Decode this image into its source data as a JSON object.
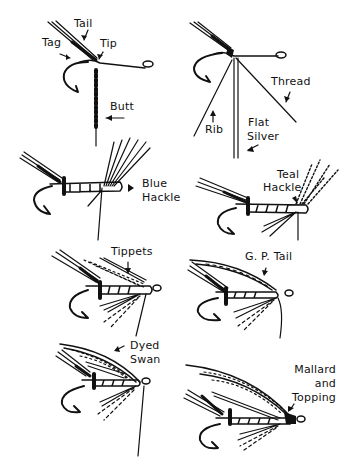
{
  "diagram": {
    "ink_color": "#111111",
    "background": "#ffffff",
    "panels": [
      {
        "id": "tail-tag-tip-butt",
        "labels": [
          "Tail",
          "Tag",
          "Tip",
          "Butt"
        ]
      },
      {
        "id": "rib-silver-thread",
        "labels": [
          "Thread",
          "Rib",
          "Flat",
          "Silver"
        ]
      },
      {
        "id": "blue-hackle",
        "labels": [
          "Blue",
          "Hackle"
        ]
      },
      {
        "id": "teal-hackle",
        "labels": [
          "Teal",
          "Hackle"
        ]
      },
      {
        "id": "tippets",
        "labels": [
          "Tippets"
        ]
      },
      {
        "id": "gp-tail",
        "labels": [
          "G. P. Tail"
        ]
      },
      {
        "id": "dyed-swan",
        "labels": [
          "Dyed",
          "Swan"
        ]
      },
      {
        "id": "mallard-topping",
        "labels": [
          "Mallard",
          "and",
          "Topping"
        ]
      }
    ]
  },
  "labels": {
    "tail": "Tail",
    "tag": "Tag",
    "tip": "Tip",
    "butt": "Butt",
    "thread": "Thread",
    "rib": "Rib",
    "flat": "Flat",
    "silver": "Silver",
    "blue": "Blue",
    "blue_hackle": "Hackle",
    "teal": "Teal",
    "teal_hackle": "Hackle",
    "tippets": "Tippets",
    "gp_tail": "G. P. Tail",
    "dyed": "Dyed",
    "swan": "Swan",
    "mallard": "Mallard",
    "and": "and",
    "topping": "Topping"
  }
}
